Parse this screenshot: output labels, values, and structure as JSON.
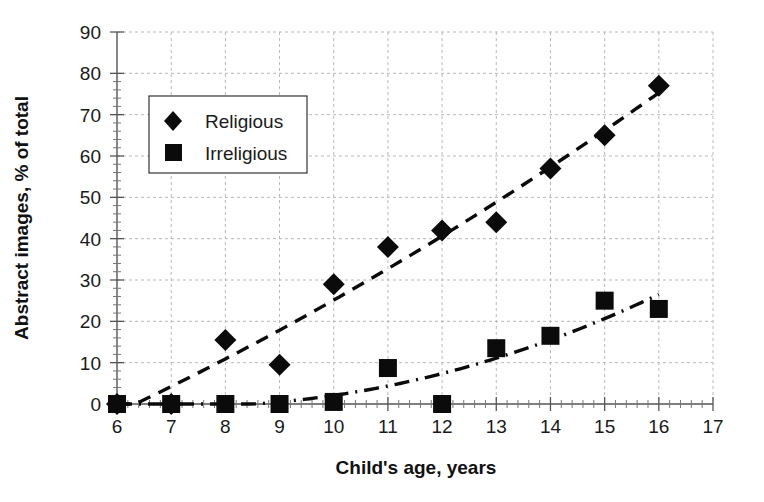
{
  "chart_data": {
    "type": "scatter",
    "title": "",
    "xlabel": "Child's age, years",
    "ylabel": "Abstract images, % of total",
    "xlim": [
      6,
      17
    ],
    "ylim": [
      0,
      90
    ],
    "xticks": [
      6,
      7,
      8,
      9,
      10,
      11,
      12,
      13,
      14,
      15,
      16,
      17
    ],
    "yticks": [
      0,
      10,
      20,
      30,
      40,
      50,
      60,
      70,
      80,
      90
    ],
    "grid": true,
    "legend_position": "upper-left-inside",
    "x": [
      6,
      7,
      8,
      9,
      10,
      11,
      12,
      13,
      14,
      15,
      16
    ],
    "series": [
      {
        "name": "Religious",
        "marker": "diamond",
        "trendline": "dashed",
        "values": [
          0,
          0,
          15.5,
          9.5,
          29,
          38,
          42,
          44,
          57,
          65,
          77
        ]
      },
      {
        "name": "Irreligious",
        "marker": "square",
        "trendline": "dash-dot",
        "values": [
          0,
          0,
          0,
          0,
          0.5,
          8.7,
          0,
          13.5,
          16.5,
          25,
          23
        ]
      }
    ]
  },
  "axes": {
    "y_tick_labels": [
      "90",
      "80",
      "70",
      "60",
      "50",
      "40",
      "30",
      "20",
      "10",
      "0"
    ],
    "x_tick_labels": [
      "6",
      "7",
      "8",
      "9",
      "10",
      "11",
      "12",
      "13",
      "14",
      "15",
      "16",
      "17"
    ],
    "x_axis_title": "Child's age, years",
    "y_axis_title": "Abstract images, % of total"
  },
  "legend": {
    "items": [
      {
        "label": "Religious",
        "marker": "diamond"
      },
      {
        "label": "Irreligious",
        "marker": "square"
      }
    ]
  },
  "colors": {
    "marker": "#0b0b0b",
    "grid": "#b9b9b9",
    "axis": "#555555",
    "text": "#1a1a1a",
    "background": "#ffffff"
  }
}
